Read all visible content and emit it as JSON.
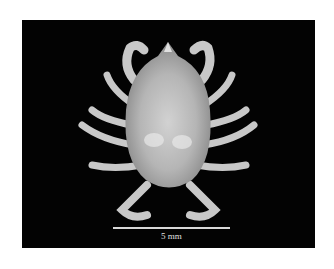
{
  "figure": {
    "background_color": "#030303",
    "scale_bar": {
      "label": "5 mm"
    }
  }
}
